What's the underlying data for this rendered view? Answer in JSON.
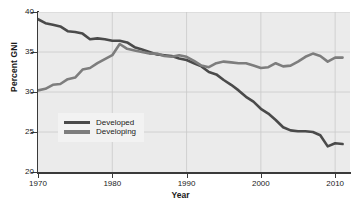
{
  "chart_data": {
    "type": "line",
    "title": "",
    "xlabel": "Year",
    "ylabel": "Percent GNI",
    "xlim": [
      1970,
      2012
    ],
    "ylim": [
      20,
      40
    ],
    "xticks": [
      1970,
      1980,
      1990,
      2000,
      2010
    ],
    "yticks": [
      20,
      25,
      30,
      35,
      40
    ],
    "grid": true,
    "legend_position": "lower-left-inside",
    "x": [
      1970,
      1971,
      1972,
      1973,
      1974,
      1975,
      1976,
      1977,
      1978,
      1979,
      1980,
      1981,
      1982,
      1983,
      1984,
      1985,
      1986,
      1987,
      1988,
      1989,
      1990,
      1991,
      1992,
      1993,
      1994,
      1995,
      1996,
      1997,
      1998,
      1999,
      2000,
      2001,
      2002,
      2003,
      2004,
      2005,
      2006,
      2007,
      2008,
      2009,
      2010,
      2011
    ],
    "series": [
      {
        "name": "Developed",
        "color": "#4a4a4a",
        "values": [
          39.1,
          38.6,
          38.4,
          38.2,
          37.6,
          37.5,
          37.3,
          36.6,
          36.7,
          36.6,
          36.4,
          36.4,
          36.2,
          35.6,
          35.3,
          35.0,
          34.7,
          34.6,
          34.5,
          34.2,
          34.0,
          33.6,
          33.2,
          32.5,
          32.2,
          31.5,
          30.9,
          30.2,
          29.4,
          28.8,
          27.9,
          27.3,
          26.5,
          25.6,
          25.2,
          25.1,
          25.1,
          25.0,
          24.6,
          23.2,
          23.6,
          23.5
        ]
      },
      {
        "name": "Developing",
        "color": "#7d7d7d",
        "values": [
          30.2,
          30.4,
          30.9,
          31.0,
          31.6,
          31.8,
          32.8,
          33.0,
          33.6,
          34.1,
          34.6,
          36.0,
          35.4,
          35.2,
          35.0,
          34.8,
          34.8,
          34.5,
          34.4,
          34.6,
          34.4,
          33.9,
          33.3,
          33.1,
          33.6,
          33.8,
          33.7,
          33.6,
          33.6,
          33.3,
          33.0,
          33.1,
          33.6,
          33.2,
          33.3,
          33.8,
          34.4,
          34.8,
          34.5,
          33.8,
          34.3,
          34.3
        ]
      }
    ]
  },
  "axes": {
    "ylabel": "Percent GNI",
    "xlabel": "Year",
    "ytick_labels": [
      "20",
      "25",
      "30",
      "35",
      "40"
    ],
    "xtick_labels": [
      "1970",
      "1980",
      "1990",
      "2000",
      "2010"
    ]
  },
  "legend": {
    "items": [
      {
        "label": "Developed",
        "color": "#4a4a4a"
      },
      {
        "label": "Developing",
        "color": "#7d7d7d"
      }
    ]
  },
  "colors": {
    "plot_background": "#ebebeb",
    "grid": "#c9c9c9",
    "axis": "#3a3a3a",
    "text": "#1a1a1a"
  }
}
